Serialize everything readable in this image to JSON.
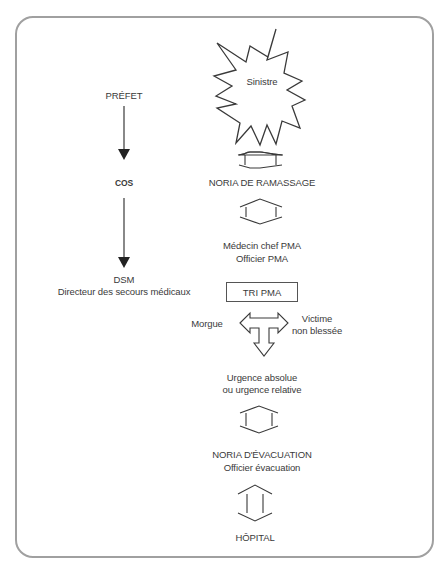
{
  "diagram": {
    "left_column": {
      "nodes": [
        {
          "id": "prefet",
          "label": "PRÉFET"
        },
        {
          "id": "cos",
          "label": "COS"
        },
        {
          "id": "dsm",
          "label": "DSM",
          "sublabel": "Directeur des secours médicaux"
        }
      ]
    },
    "main_column": {
      "sinistre": "Sinistre",
      "noria_ramassage": "NORIA DE RAMASSAGE",
      "medecin_chef": "Médecin chef PMA",
      "officier_pma": "Officier PMA",
      "tri_pma": "TRI PMA",
      "morgue": "Morgue",
      "victime_line1": "Victime",
      "victime_line2": "non blessée",
      "urgence_line1": "Urgence absolue",
      "urgence_line2": "ou urgence relative",
      "noria_evacuation": "NORIA D'ÉVACUATION",
      "officier_evacuation": "Officier évacuation",
      "hopital": "HÔPITAL"
    },
    "colors": {
      "frame": "#a0a0a0",
      "stroke": "#3a3a3a",
      "text": "#3a3a3a"
    }
  }
}
